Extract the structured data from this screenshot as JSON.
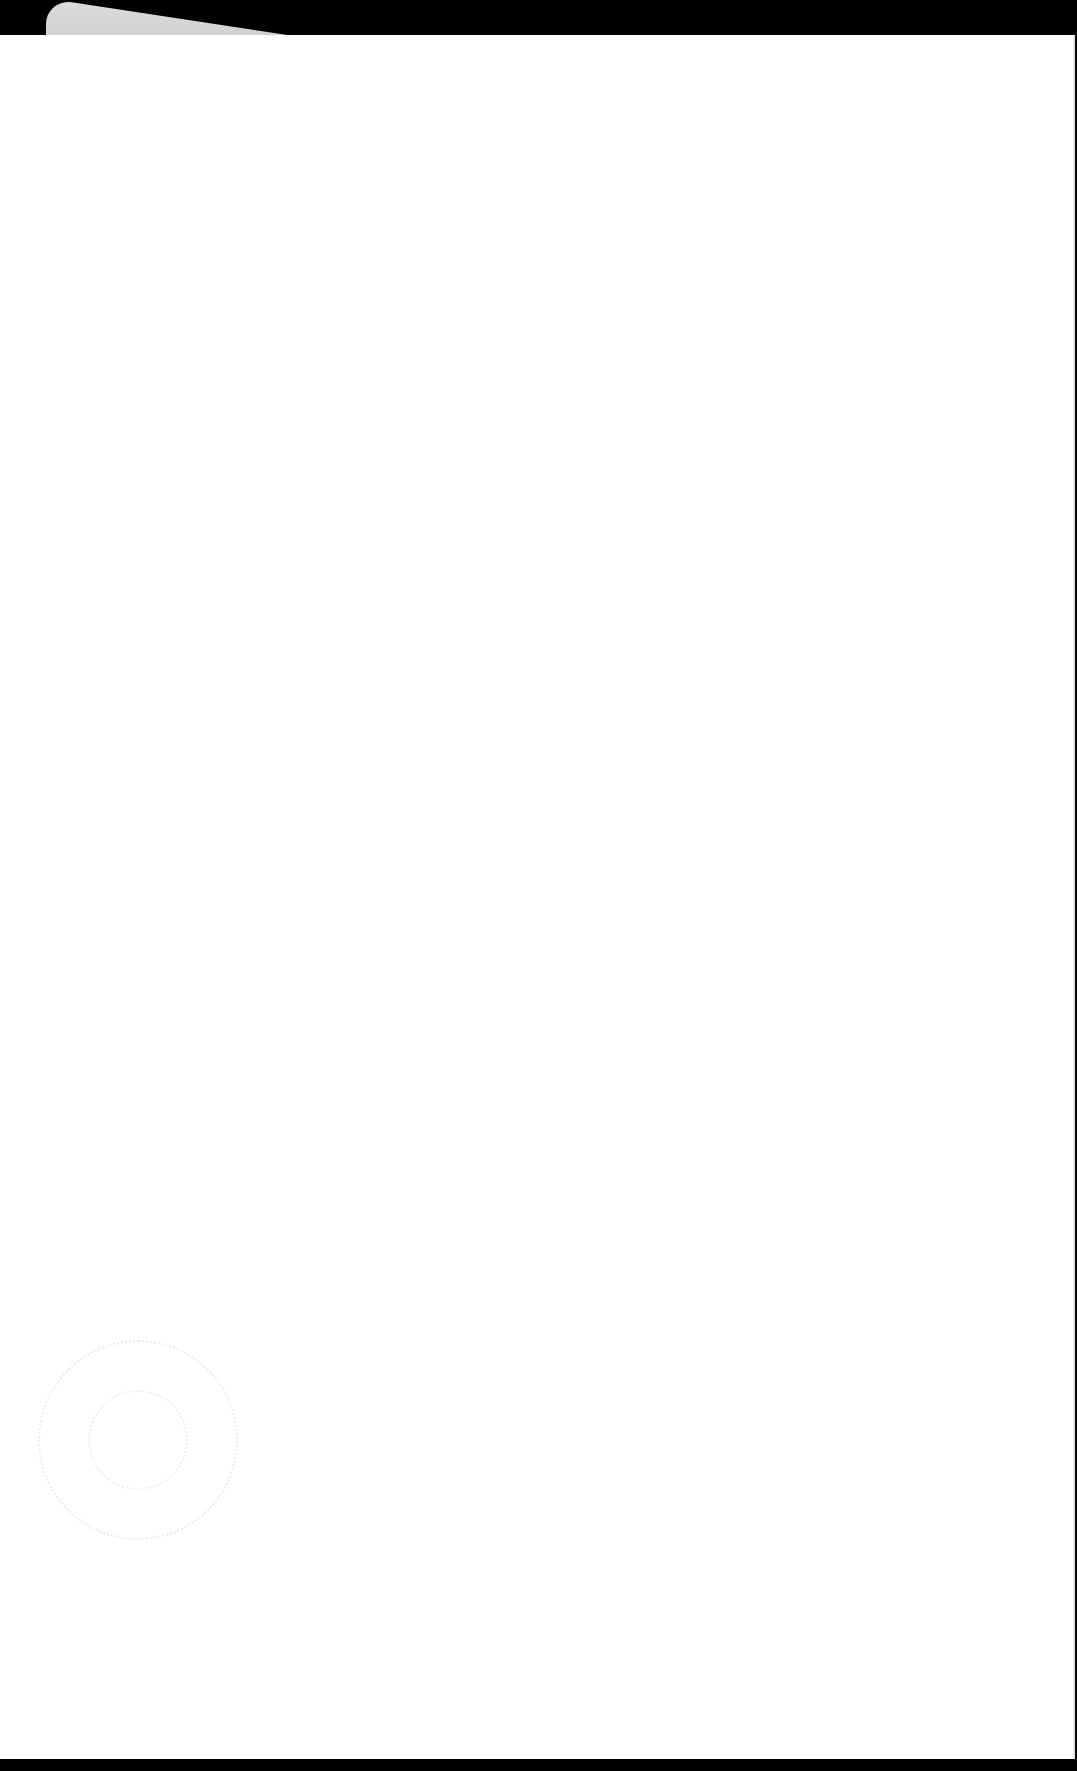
{
  "page": {
    "background_color": "#000000",
    "sheet_color": "#ffffff",
    "content": "",
    "marks": [
      {
        "type": "paper-flap",
        "position": "top-left",
        "color": "#d6d6d6"
      },
      {
        "type": "faint-circular-stamp",
        "position": "bottom-left",
        "color": "#ececec",
        "text": ""
      }
    ]
  }
}
